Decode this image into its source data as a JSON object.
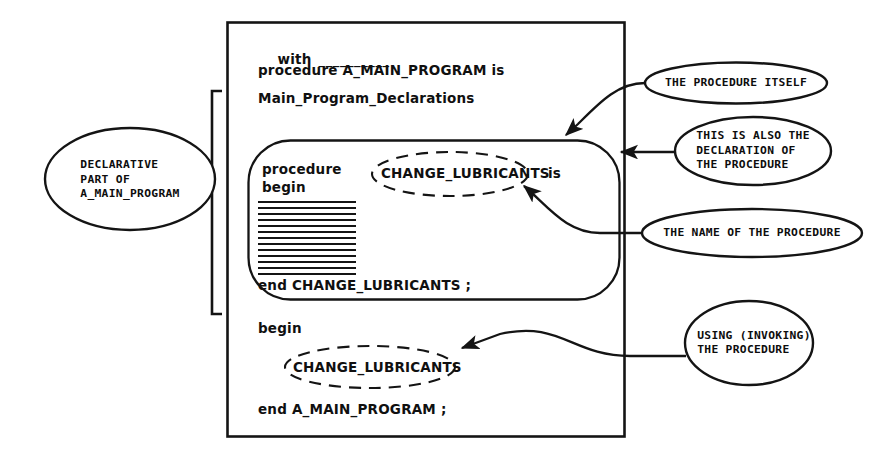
{
  "diagram": {
    "stroke_color": "#141414",
    "background_color": "#ffffff"
  },
  "code": {
    "line_with": "with",
    "line_with_blank": "__________",
    "line_procedure_decl": "procedure A_MAIN_PROGRAM is",
    "line_main_declarations": "Main_Program_Declarations",
    "inner_procedure_keyword": "procedure",
    "inner_begin_keyword": "begin",
    "inner_name": "CHANGE_LUBRICANTS",
    "inner_is_keyword": "is",
    "inner_end": "end CHANGE_LUBRICANTS ;",
    "outer_begin_keyword": "begin",
    "outer_call_name": "CHANGE_LUBRICANTS",
    "outer_end": "end A_MAIN_PROGRAM ;"
  },
  "callouts": {
    "declarative_part": {
      "lines": [
        "DECLARATIVE",
        "PART OF",
        "A_MAIN_PROGRAM"
      ],
      "text": "DECLARATIVE\nPART OF\nA_MAIN_PROGRAM"
    },
    "procedure_itself": {
      "lines": [
        "THE PROCEDURE ITSELF"
      ],
      "text": "THE PROCEDURE ITSELF"
    },
    "also_declaration": {
      "lines": [
        "THIS IS ALSO THE",
        "DECLARATION OF",
        "THE PROCEDURE"
      ],
      "text": "THIS IS ALSO THE\nDECLARATION OF\nTHE PROCEDURE"
    },
    "name_of_procedure": {
      "lines": [
        "THE NAME OF THE PROCEDURE"
      ],
      "text": "THE NAME OF THE PROCEDURE"
    },
    "using_procedure": {
      "lines": [
        "USING (INVOKING)",
        "THE PROCEDURE"
      ],
      "text": "USING (INVOKING)\nTHE PROCEDURE"
    }
  },
  "hatch": {
    "line_count": 13,
    "description": "statement body fill lines"
  }
}
